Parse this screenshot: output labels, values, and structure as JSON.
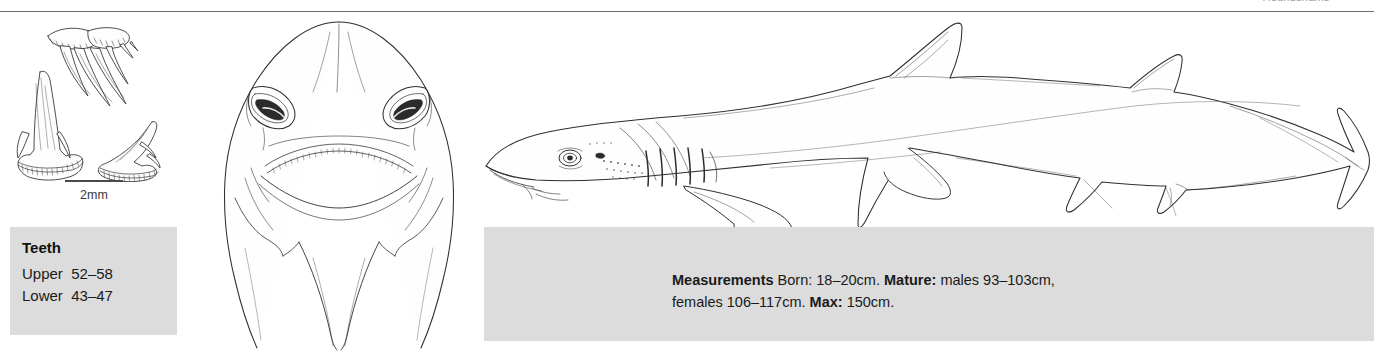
{
  "page": {
    "clipped_header": "Houndsharks",
    "rule_color": "#6d6d6d",
    "box_color": "#dcdcdc"
  },
  "scale_bar": {
    "label": "2mm",
    "icon": "scale-bar-icon"
  },
  "teeth_box": {
    "title": "Teeth",
    "rows": [
      {
        "label": "Upper",
        "value": "52–58"
      },
      {
        "label": "Lower",
        "value": "43–47"
      }
    ]
  },
  "measurements_box": {
    "title": "Measurements",
    "born_label": "Born:",
    "born_value": "18–20cm.",
    "mature_label": "Mature:",
    "mature_value": "males 93–103cm, females 106–117cm.",
    "max_label": "Max:",
    "max_value": "150cm.",
    "full_text": "Measurements Born: 18–20cm. Mature: males 93–103cm, females 106–117cm. Max: 150cm."
  },
  "illustrations": {
    "teeth_plate": {
      "name": "shark-teeth-illustration",
      "count": 3,
      "caption": "Three shark teeth shown from different angles"
    },
    "head_view": {
      "name": "shark-head-ventral-illustration",
      "caption": "Ventral view of shark head showing nostrils and mouth"
    },
    "body_view": {
      "name": "shark-lateral-illustration",
      "caption": "Lateral view of whole shark",
      "gill_slits": 5
    }
  }
}
